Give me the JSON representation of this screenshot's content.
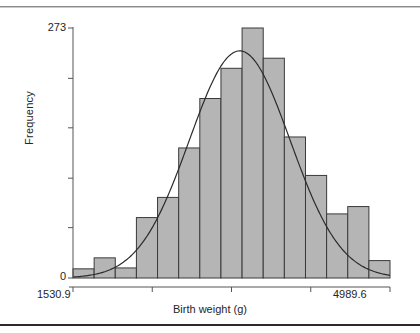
{
  "chart_data": {
    "type": "bar",
    "title": "",
    "subtitle": "",
    "xlabel": "Birth weight (g)",
    "ylabel": "Frequency",
    "grid": false,
    "legend": null,
    "axis": {
      "x_min_label": "1530.9",
      "x_max_label": "4989.6",
      "x_min": 1530.9,
      "x_max": 4989.6,
      "y_min": 0,
      "y_max": 273,
      "y_tick_labels": [
        "0",
        "273"
      ],
      "y_ticks": [
        0,
        55,
        109,
        164,
        218,
        273
      ],
      "x_ticks": [
        1530.9,
        2395.6,
        3260.3,
        4125.0,
        4989.6
      ]
    },
    "bin_count": 15,
    "bin_width": 230.6,
    "bin_edges": [
      1530.9,
      1761.5,
      1992.1,
      2222.7,
      2453.3,
      2683.9,
      2914.5,
      3145.1,
      3375.7,
      3606.3,
      3836.9,
      4067.5,
      4298.1,
      4528.7,
      4759.3,
      4989.6
    ],
    "categories": [
      "1530.9",
      "1761.5",
      "1992.1",
      "2222.7",
      "2453.3",
      "2683.9",
      "2914.5",
      "3145.1",
      "3375.7",
      "3606.3",
      "3836.9",
      "4067.5",
      "4298.1",
      "4528.7",
      "4759.3"
    ],
    "values": [
      10,
      22,
      11,
      66,
      88,
      142,
      196,
      229,
      273,
      240,
      154,
      112,
      70,
      78,
      19
    ],
    "annotations": [
      {
        "type": "normal-curve",
        "label": "fitted normal density",
        "mean": 3350,
        "sd": 550,
        "peak_value": 248
      }
    ],
    "colors": {
      "bar_fill": "#b5b5b5",
      "bar_edge": "#3a3a3a",
      "curve": "#2b2b2b",
      "axis": "#555555",
      "text": "#262626",
      "background": "#ffffff",
      "rule": "#2b2b2b"
    }
  }
}
